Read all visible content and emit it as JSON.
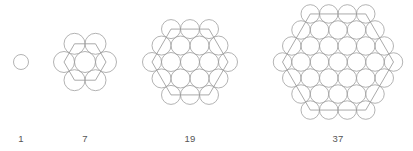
{
  "figure": {
    "background_color": "#ffffff",
    "circle_stroke_color": "#9a9a9a",
    "hexagon_stroke_color": "#8e8e8e",
    "label_color": "#555555",
    "label_baseline_y": 144
  },
  "chart_data": {
    "type": "diagram",
    "xlabel": "",
    "ylabel": "",
    "categories": [
      "1",
      "7",
      "19",
      "37"
    ],
    "values": [
      1,
      7,
      19,
      37
    ],
    "series": [
      {
        "name": "circle count",
        "values": [
          1,
          7,
          19,
          37
        ]
      },
      {
        "name": "hexagon ring index",
        "values": [
          0,
          1,
          2,
          3
        ]
      }
    ],
    "annotations": [
      "Each figure is a hexagonal packing of unit circles.",
      "Figure n has rows of circles forming a regular hexagon of side n+1.",
      "Counts follow the centered hexagonal numbers 1, 7, 19, 37."
    ],
    "legend_position": "none",
    "grid": false
  },
  "figures": [
    {
      "id": "figure-1",
      "label": "1",
      "count": 1,
      "rings": 0,
      "row_counts": [
        1
      ],
      "center_x": 21,
      "center_y": 62,
      "circle_diameter": 15,
      "label_x": 21,
      "has_hexagon_outline": false
    },
    {
      "id": "figure-7",
      "label": "7",
      "count": 7,
      "rings": 1,
      "row_counts": [
        2,
        3,
        2
      ],
      "center_x": 85,
      "center_y": 62,
      "circle_diameter": 21,
      "label_x": 85,
      "has_hexagon_outline": true
    },
    {
      "id": "figure-19",
      "label": "19",
      "count": 19,
      "rings": 2,
      "row_counts": [
        3,
        4,
        5,
        4,
        3
      ],
      "center_x": 190,
      "center_y": 62,
      "circle_diameter": 19,
      "label_x": 190,
      "has_hexagon_outline": true
    },
    {
      "id": "figure-37",
      "label": "37",
      "count": 37,
      "rings": 3,
      "row_counts": [
        4,
        5,
        6,
        7,
        6,
        5,
        4
      ],
      "center_x": 338,
      "center_y": 62,
      "circle_diameter": 18.5,
      "label_x": 338,
      "has_hexagon_outline": true
    }
  ]
}
